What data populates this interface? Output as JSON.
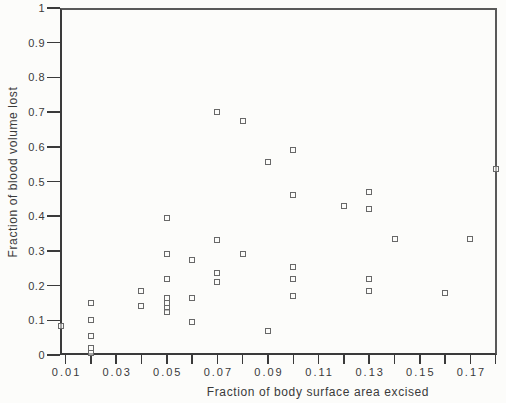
{
  "figure": {
    "background_color": "#fcfcfa",
    "axis_color": "#3a3a3a",
    "marker_color": "#686868"
  },
  "chart_data": {
    "type": "scatter",
    "title": "",
    "xlabel": "Fraction of body surface area excised",
    "ylabel": "Fraction of blood volume lost",
    "xlim": [
      0.0078,
      0.1805
    ],
    "ylim": [
      0,
      1
    ],
    "grid": false,
    "legend": null,
    "marker": "open-square",
    "x_tick_values": [
      0.01,
      0.02,
      0.03,
      0.04,
      0.05,
      0.06,
      0.07,
      0.08,
      0.09,
      0.1,
      0.11,
      0.12,
      0.13,
      0.14,
      0.15,
      0.16,
      0.17,
      0.18
    ],
    "x_tick_labels": [
      {
        "v": 0.01,
        "text": "0.01"
      },
      {
        "v": 0.03,
        "text": "0.03"
      },
      {
        "v": 0.05,
        "text": "0.05"
      },
      {
        "v": 0.07,
        "text": "0.07"
      },
      {
        "v": 0.09,
        "text": "0.09"
      },
      {
        "v": 0.11,
        "text": "0.11"
      },
      {
        "v": 0.13,
        "text": "0.13"
      },
      {
        "v": 0.15,
        "text": "0.15"
      },
      {
        "v": 0.17,
        "text": "0.17"
      }
    ],
    "y_tick_values": [
      0,
      0.1,
      0.2,
      0.3,
      0.4,
      0.5,
      0.6,
      0.7,
      0.8,
      0.9,
      1
    ],
    "y_tick_labels": [
      "0",
      "0.1",
      "0.2",
      "0.3",
      "0.4",
      "0.5",
      "0.6",
      "0.7",
      "0.8",
      "0.9",
      "1"
    ],
    "points": [
      [
        0.008,
        0.085
      ],
      [
        0.02,
        0.15
      ],
      [
        0.02,
        0.1
      ],
      [
        0.02,
        0.055
      ],
      [
        0.02,
        0.02
      ],
      [
        0.02,
        0.005
      ],
      [
        0.04,
        0.185
      ],
      [
        0.04,
        0.14
      ],
      [
        0.05,
        0.395
      ],
      [
        0.05,
        0.29
      ],
      [
        0.05,
        0.22
      ],
      [
        0.05,
        0.165
      ],
      [
        0.05,
        0.15
      ],
      [
        0.05,
        0.135
      ],
      [
        0.05,
        0.125
      ],
      [
        0.06,
        0.275
      ],
      [
        0.06,
        0.165
      ],
      [
        0.06,
        0.095
      ],
      [
        0.07,
        0.7
      ],
      [
        0.07,
        0.33
      ],
      [
        0.07,
        0.235
      ],
      [
        0.07,
        0.21
      ],
      [
        0.08,
        0.675
      ],
      [
        0.08,
        0.29
      ],
      [
        0.09,
        0.555
      ],
      [
        0.09,
        0.07
      ],
      [
        0.1,
        0.59
      ],
      [
        0.1,
        0.46
      ],
      [
        0.1,
        0.255
      ],
      [
        0.1,
        0.22
      ],
      [
        0.1,
        0.17
      ],
      [
        0.12,
        0.43
      ],
      [
        0.13,
        0.47
      ],
      [
        0.13,
        0.42
      ],
      [
        0.13,
        0.22
      ],
      [
        0.13,
        0.185
      ],
      [
        0.14,
        0.335
      ],
      [
        0.16,
        0.18
      ],
      [
        0.17,
        0.335
      ],
      [
        0.18,
        0.535
      ]
    ]
  }
}
